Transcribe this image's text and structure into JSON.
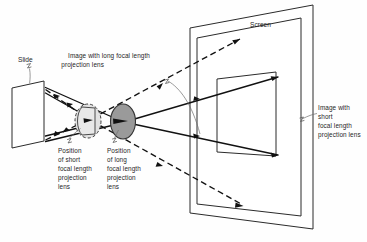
{
  "figure": {
    "background_color": "#fefefe",
    "ink_color": "#111111",
    "labels": {
      "slide": "Slide",
      "screen": "Screen",
      "image_long": {
        "line1": "Image with long focal length",
        "line2": "projection lens"
      },
      "position_short": {
        "line1": "Position",
        "line2": "of short",
        "line3": "focal length",
        "line4": "projection",
        "line5": "lens"
      },
      "position_long": {
        "line1": "Position",
        "line2": "of long",
        "line3": "focal length",
        "line4": "projection",
        "line5": "lens"
      },
      "image_short": {
        "line1": "Image with",
        "line2": "short",
        "line3": "focal length",
        "line4": "projection lens"
      }
    },
    "elements": {
      "lens_short_color": "#e8e8e8",
      "lens_long_color": "#9a9a9a",
      "ray_solid_style": "solid",
      "ray_dashed_style": "dashed"
    }
  }
}
